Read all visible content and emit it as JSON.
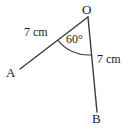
{
  "figure": {
    "type": "angle-diagram",
    "width": 133,
    "height": 131,
    "background_color": "#ffffff",
    "stroke_color": "#3a3a3a",
    "text_color": "#1a1a1a"
  },
  "labels": {
    "vertex_O": "O",
    "vertex_A": "A",
    "vertex_B": "B",
    "length_OA": "7 cm",
    "length_OB": "7 cm",
    "angle_AOB": "60°"
  },
  "geometry": {
    "points": {
      "O": {
        "x": 88,
        "y": 17
      },
      "A": {
        "x": 20,
        "y": 69
      },
      "B": {
        "x": 97,
        "y": 112
      }
    },
    "segments": [
      {
        "name": "OA",
        "from": "O",
        "to": "A",
        "length_label": "7 cm"
      },
      {
        "name": "OB",
        "from": "O",
        "to": "B",
        "length_label": "7 cm"
      }
    ],
    "angle_arc": {
      "at": "O",
      "between": [
        "OA",
        "OB"
      ],
      "measure_label": "60°",
      "radius": 38
    }
  }
}
